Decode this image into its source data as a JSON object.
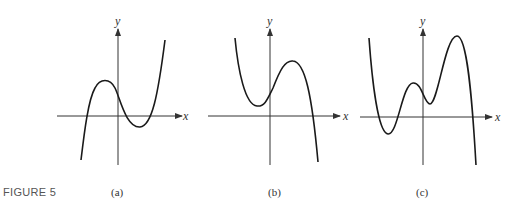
{
  "figure_label": "FIGURE 5",
  "panels": [
    {
      "id": "a",
      "caption": "(a)",
      "x_axis_label": "x",
      "y_axis_label": "y"
    },
    {
      "id": "b",
      "caption": "(b)",
      "x_axis_label": "x",
      "y_axis_label": "y"
    },
    {
      "id": "c",
      "caption": "(c)",
      "x_axis_label": "x",
      "y_axis_label": "y"
    }
  ],
  "colors": {
    "curve": "#1a1a1a",
    "axis": "#333333",
    "background": "#ffffff"
  }
}
